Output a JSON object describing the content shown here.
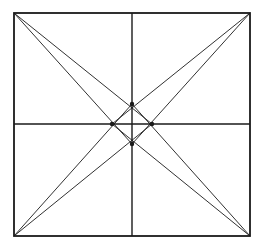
{
  "diagram": {
    "stroke_color": "#1a1a1a",
    "background": "#ffffff",
    "square": {
      "x1": 14,
      "y1": 13,
      "x2": 250,
      "y2": 236
    },
    "midlines": {
      "vertical": {
        "x": 132,
        "y1": 13,
        "y2": 236
      },
      "horizontal": {
        "y": 124,
        "x1": 14,
        "x2": 250
      }
    },
    "center_points": [
      {
        "name": "top",
        "x": 132,
        "y": 104
      },
      {
        "name": "left",
        "x": 112,
        "y": 124
      },
      {
        "name": "right",
        "x": 152,
        "y": 124
      },
      {
        "name": "bottom",
        "x": 132,
        "y": 144
      }
    ],
    "corner_lines": [
      {
        "from": "top-left",
        "x1": 14,
        "y1": 13,
        "x2": 152,
        "y2": 124
      },
      {
        "from": "top-left",
        "x1": 14,
        "y1": 13,
        "x2": 132,
        "y2": 144
      },
      {
        "from": "top-right",
        "x1": 250,
        "y1": 13,
        "x2": 112,
        "y2": 124
      },
      {
        "from": "top-right",
        "x1": 250,
        "y1": 13,
        "x2": 132,
        "y2": 144
      },
      {
        "from": "bottom-left",
        "x1": 14,
        "y1": 236,
        "x2": 132,
        "y2": 104
      },
      {
        "from": "bottom-left",
        "x1": 14,
        "y1": 236,
        "x2": 152,
        "y2": 124
      },
      {
        "from": "bottom-right",
        "x1": 250,
        "y1": 236,
        "x2": 132,
        "y2": 104
      },
      {
        "from": "bottom-right",
        "x1": 250,
        "y1": 236,
        "x2": 112,
        "y2": 124
      }
    ]
  }
}
